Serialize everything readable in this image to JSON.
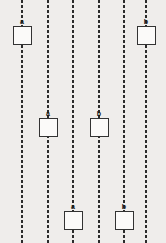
{
  "canvas": {
    "width": 166,
    "height": 243,
    "background_color": "#efedeb"
  },
  "style": {
    "line_color": "#2b2b2b",
    "box_fill_color": "#fbfaf9",
    "box_border_color": "#333333",
    "label_color": "#191919",
    "line_style": "dashed",
    "line_width_px": 2,
    "box_size_px": 19
  },
  "tracks": [
    {
      "id": "track-1",
      "x": 22
    },
    {
      "id": "track-2",
      "x": 48
    },
    {
      "id": "track-3",
      "x": 73
    },
    {
      "id": "track-4",
      "x": 99
    },
    {
      "id": "track-5",
      "x": 124
    },
    {
      "id": "track-6",
      "x": 146
    }
  ],
  "nodes": [
    {
      "id": "node-1",
      "label": "a",
      "track": 1,
      "x": 22,
      "y": 18,
      "row": "top"
    },
    {
      "id": "node-2",
      "label": "a",
      "track": 2,
      "x": 48,
      "y": 110,
      "row": "middle"
    },
    {
      "id": "node-3",
      "label": "a",
      "track": 3,
      "x": 73,
      "y": 203,
      "row": "bottom"
    },
    {
      "id": "node-4",
      "label": "b",
      "track": 4,
      "x": 99,
      "y": 110,
      "row": "middle"
    },
    {
      "id": "node-5",
      "label": "b",
      "track": 5,
      "x": 124,
      "y": 203,
      "row": "bottom"
    },
    {
      "id": "node-6",
      "label": "b",
      "track": 6,
      "x": 146,
      "y": 18,
      "row": "top"
    }
  ]
}
